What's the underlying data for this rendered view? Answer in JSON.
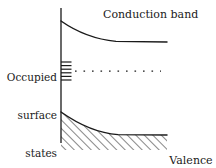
{
  "figure": {
    "kind": "semiconductor-band-bending-diagram",
    "background_color": "#ffffff",
    "line_color": "#1a1a1a"
  },
  "labels": {
    "occupied_surface_states": "Occupied\nsurface\nstates",
    "occupied_surface_states_lines": [
      "Occupied",
      "surface",
      "states"
    ],
    "conduction_band": "Conduction band",
    "valence_band": "Valence\nband",
    "valence_band_lines": [
      "Valence",
      "band"
    ]
  },
  "diagram": {
    "vertical_axis": {
      "x": 61,
      "y_top": 8,
      "y_bottom": 143
    },
    "conduction_band_curve": {
      "start": [
        61,
        21
      ],
      "end": [
        167,
        42
      ],
      "asymptote_y": 42
    },
    "valence_band_curve": {
      "start": [
        61,
        112
      ],
      "end": [
        167,
        135
      ],
      "asymptote_y": 135
    },
    "fermi_dotted_line": {
      "x_start": 74,
      "x_end": 161,
      "y": 71,
      "dot_count": 11
    },
    "surface_state_ticks": {
      "x_start": 61,
      "x_end": 71,
      "y_values": [
        62,
        65.5,
        69,
        72.5,
        76,
        79.5
      ]
    },
    "hatching": {
      "x_start": 61,
      "x_end": 167,
      "angle_deg": 45,
      "spacing": 6,
      "bottom_y": 147
    }
  }
}
